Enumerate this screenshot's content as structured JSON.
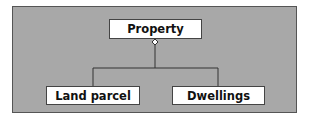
{
  "diagram": {
    "type": "aggregation",
    "parent": {
      "label": "Property"
    },
    "children": [
      {
        "label": "Land parcel"
      },
      {
        "label": "Dwellings"
      }
    ],
    "relationship_symbol": "hollow-diamond",
    "colors": {
      "background": "#a8a8a8",
      "node_fill": "#ffffff",
      "line": "#333333"
    }
  }
}
